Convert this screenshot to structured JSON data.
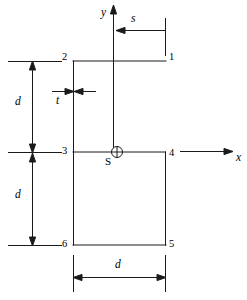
{
  "figure": {
    "type": "cross-section-diagram",
    "stroke_color": "#1a1a1a",
    "background_color": "#ffffff"
  },
  "axes": {
    "y_label": "y",
    "x_label": "x",
    "origin_marker": "shear-center-circle-cross"
  },
  "shear_center": {
    "label": "S"
  },
  "nodes": [
    {
      "id": "1",
      "label": "1",
      "x": 165,
      "y": 61
    },
    {
      "id": "2",
      "label": "2",
      "x": 73,
      "y": 61
    },
    {
      "id": "3",
      "label": "3",
      "x": 73,
      "y": 152
    },
    {
      "id": "4",
      "label": "4",
      "x": 165,
      "y": 152
    },
    {
      "id": "5",
      "label": "5",
      "x": 165,
      "y": 245
    },
    {
      "id": "6",
      "label": "6",
      "x": 73,
      "y": 245
    }
  ],
  "dimensions": [
    {
      "name": "upper-depth",
      "label": "d",
      "orientation": "vertical"
    },
    {
      "name": "lower-depth",
      "label": "d",
      "orientation": "vertical"
    },
    {
      "name": "width",
      "label": "d",
      "orientation": "horizontal"
    },
    {
      "name": "thickness",
      "label": "t",
      "orientation": "horizontal"
    },
    {
      "name": "shear-center-offset",
      "label": "s",
      "orientation": "horizontal"
    }
  ]
}
